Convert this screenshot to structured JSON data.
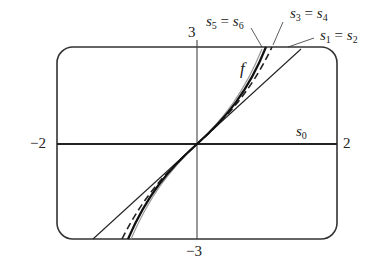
{
  "figure": {
    "type": "function approximation plot",
    "axes": {
      "x_min_label": "−2",
      "x_max_label": "2",
      "y_max_label": "3",
      "y_min_label": "−3"
    },
    "curves": [
      {
        "name": "f",
        "label": "f",
        "style": "solid thick"
      },
      {
        "name": "s0",
        "label_base": "s",
        "label_sub": "0",
        "style": "solid (x-axis)"
      },
      {
        "name": "s1=s2",
        "label": "s1 = s2",
        "style": "solid thin line"
      },
      {
        "name": "s3=s4",
        "label": "s3 = s4",
        "style": "dashed"
      },
      {
        "name": "s5=s6",
        "label": "s5 = s6",
        "style": "thin gray"
      }
    ],
    "labels": {
      "f": "f",
      "s0": {
        "base": "s",
        "sub": "0"
      },
      "s12": {
        "a": "s",
        "a_sub": "1",
        "eq": " = ",
        "b": "s",
        "b_sub": "2"
      },
      "s34": {
        "a": "s",
        "a_sub": "3",
        "eq": " = ",
        "b": "s",
        "b_sub": "4"
      },
      "s56": {
        "a": "s",
        "a_sub": "5",
        "eq": " = ",
        "b": "s",
        "b_sub": "6"
      }
    },
    "colors": {
      "stroke": "#222222",
      "gray": "#999999",
      "background": "#ffffff"
    }
  }
}
